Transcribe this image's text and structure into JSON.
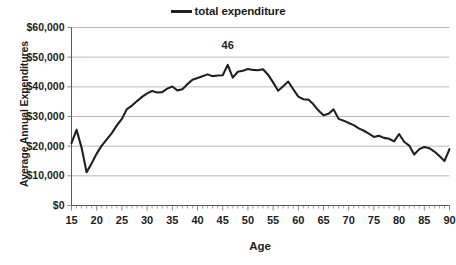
{
  "chart_data": {
    "type": "line",
    "title": "",
    "xlabel": "Age",
    "ylabel": "Average Annual Expenditures",
    "xlim": [
      15,
      90
    ],
    "ylim": [
      0,
      60000
    ],
    "grid": true,
    "legend_position": "top-center",
    "legend": [
      "total expenditure"
    ],
    "ytick_labels": [
      "$0",
      "$10,000",
      "$20,000",
      "$30,000",
      "$40,000",
      "$50,000",
      "$60,000"
    ],
    "ytick_values": [
      0,
      10000,
      20000,
      30000,
      40000,
      50000,
      60000
    ],
    "xtick_labels": [
      "15",
      "20",
      "25",
      "30",
      "35",
      "40",
      "45",
      "50",
      "55",
      "60",
      "65",
      "70",
      "75",
      "80",
      "85",
      "90"
    ],
    "xtick_values": [
      15,
      20,
      25,
      30,
      35,
      40,
      45,
      50,
      55,
      60,
      65,
      70,
      75,
      80,
      85,
      90
    ],
    "annotations": [
      {
        "text": "46",
        "x": 46,
        "y": 52600
      }
    ],
    "series": [
      {
        "name": "total expenditure",
        "color": "#202020",
        "x": [
          15,
          16,
          17,
          18,
          19,
          20,
          21,
          22,
          23,
          24,
          25,
          26,
          27,
          28,
          29,
          30,
          31,
          32,
          33,
          34,
          35,
          36,
          37,
          38,
          39,
          40,
          41,
          42,
          43,
          44,
          45,
          46,
          47,
          48,
          49,
          50,
          51,
          52,
          53,
          54,
          55,
          56,
          57,
          58,
          59,
          60,
          61,
          62,
          63,
          64,
          65,
          66,
          67,
          68,
          69,
          70,
          71,
          72,
          73,
          74,
          75,
          76,
          77,
          78,
          79,
          80,
          81,
          82,
          83,
          84,
          85,
          86,
          87,
          88,
          89,
          90
        ],
        "values": [
          21000,
          25500,
          19500,
          11200,
          14200,
          17500,
          20200,
          22300,
          24400,
          27000,
          29200,
          32500,
          33700,
          35200,
          36600,
          37800,
          38600,
          38100,
          38200,
          39400,
          40100,
          38800,
          39200,
          40900,
          42400,
          43000,
          43600,
          44200,
          43600,
          43800,
          43900,
          47400,
          43100,
          45100,
          45400,
          46000,
          45700,
          45600,
          45900,
          44100,
          41500,
          38700,
          40200,
          41800,
          39200,
          36700,
          35800,
          35700,
          34100,
          32000,
          30400,
          30900,
          32400,
          29200,
          28600,
          27800,
          27100,
          26000,
          25200,
          24200,
          23100,
          23500,
          22800,
          22500,
          21600,
          24100,
          21500,
          20200,
          17200,
          19000,
          19700,
          19300,
          18200,
          16700,
          15000,
          19000
        ]
      }
    ]
  }
}
